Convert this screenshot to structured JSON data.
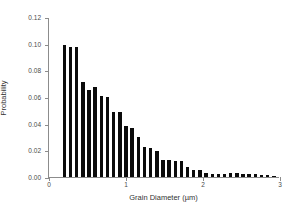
{
  "chart_data": {
    "type": "bar",
    "title": "",
    "xlabel": "Grain Diameter (µm)",
    "ylabel": "Probability",
    "xlim": [
      0,
      3
    ],
    "ylim": [
      0.0,
      0.12
    ],
    "grid": false,
    "legend": null,
    "bar_color": "#0b0b0b",
    "axis_color": "#8c8c8c",
    "bar_width_um": 0.045,
    "xticks": [
      "0",
      "1",
      "2",
      "3"
    ],
    "xtick_values": [
      0,
      1,
      2,
      3
    ],
    "yticks": [
      "0.00",
      "0.02",
      "0.04",
      "0.06",
      "0.08",
      "0.10",
      "0.12"
    ],
    "ytick_values": [
      0.0,
      0.02,
      0.04,
      0.06,
      0.08,
      0.1,
      0.12
    ],
    "x": [
      0.2,
      0.28,
      0.36,
      0.44,
      0.52,
      0.6,
      0.68,
      0.76,
      0.84,
      0.92,
      1.0,
      1.08,
      1.16,
      1.24,
      1.32,
      1.4,
      1.48,
      1.56,
      1.64,
      1.72,
      1.8,
      1.88,
      1.96,
      2.04,
      2.12,
      2.2,
      2.28,
      2.36,
      2.44,
      2.52,
      2.6,
      2.68,
      2.76,
      2.84,
      2.92
    ],
    "values": [
      0.099,
      0.0975,
      0.0973,
      0.0715,
      0.0652,
      0.0678,
      0.0605,
      0.0598,
      0.0488,
      0.0486,
      0.0382,
      0.0368,
      0.0298,
      0.0228,
      0.0215,
      0.0198,
      0.0128,
      0.0126,
      0.0123,
      0.0122,
      0.0072,
      0.0055,
      0.0054,
      0.0028,
      0.0026,
      0.0024,
      0.0023,
      0.0032,
      0.003,
      0.0022,
      0.0024,
      0.0022,
      0.0012,
      0.0013,
      0.0008
    ]
  }
}
